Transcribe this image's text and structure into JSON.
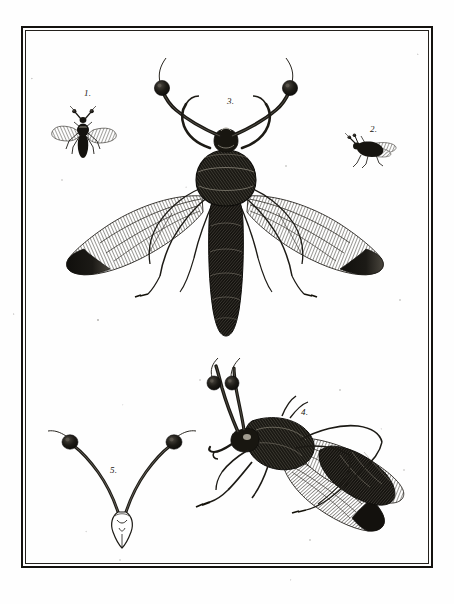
{
  "plate": {
    "medium": "copperplate engraving",
    "subject": "stalk-eyed flies (Diopsidae) natural history plate",
    "paper_color": "#fefefe",
    "ink_color": "#17150f",
    "width": 454,
    "height": 604
  },
  "frame": {
    "style": "double rule border",
    "outer_color": "#14120f",
    "inner_color": "#23201c"
  },
  "figures": [
    {
      "id": "fig-1",
      "label": "1.",
      "description": "small winged fly, dorsal view, with short stalked eyes",
      "label_x": 84,
      "label_y": 89,
      "art_x": 61,
      "art_y": 104,
      "art_w": 62,
      "art_h": 50
    },
    {
      "id": "fig-2",
      "label": "2.",
      "description": "small fly, lateral view, wings folded",
      "label_x": 370,
      "label_y": 125,
      "art_x": 348,
      "art_y": 136,
      "art_w": 48,
      "art_h": 34
    },
    {
      "id": "fig-3",
      "label": "3.",
      "description": "large stalk-eyed fly, dorsal view, wings spread, long eye stalks with dark knobs",
      "label_x": 227,
      "label_y": 97,
      "art_x": 60,
      "art_y": 56,
      "art_w": 320,
      "art_h": 300
    },
    {
      "id": "fig-4",
      "label": "4.",
      "description": "stalk-eyed fly, lateral view, wings folded back, eye stalks raised",
      "label_x": 301,
      "label_y": 408,
      "art_x": 186,
      "art_y": 366,
      "art_w": 244,
      "art_h": 178
    },
    {
      "id": "fig-5",
      "label": "5.",
      "description": "detached head detail showing V-shaped eye stalks with terminal dark knobs",
      "label_x": 110,
      "label_y": 466,
      "art_x": 47,
      "art_y": 424,
      "art_w": 140,
      "art_h": 110
    }
  ]
}
